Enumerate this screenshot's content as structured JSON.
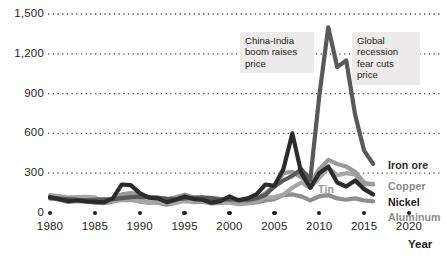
{
  "chart_data": {
    "type": "line",
    "title": "",
    "subtitle": "",
    "xlabel": "Year",
    "ylabel": "",
    "xlim": [
      1979,
      2022
    ],
    "ylim": [
      0,
      1500
    ],
    "grid": true,
    "legend_position": "right-inline",
    "y_ticks": [
      "0",
      "300",
      "600",
      "900",
      "1,200",
      "1,500"
    ],
    "y_tick_values": [
      0,
      300,
      600,
      900,
      1200,
      1500
    ],
    "x_ticks": [
      "1980",
      "1985",
      "1990",
      "1995",
      "2000",
      "2005",
      "2010",
      "2015",
      "2020"
    ],
    "x_tick_values": [
      1980,
      1985,
      1990,
      1995,
      2000,
      2005,
      2010,
      2015,
      2020
    ],
    "series": [
      {
        "name": "Iron ore",
        "color": "#595959",
        "width": 4.2,
        "label_color": "#2b2b2b",
        "label_bold": true,
        "label_x": 388,
        "label_y": 159,
        "x": [
          1980,
          1981,
          1982,
          1983,
          1984,
          1985,
          1986,
          1987,
          1988,
          1989,
          1990,
          1991,
          1992,
          1993,
          1994,
          1995,
          1996,
          1997,
          1998,
          1999,
          2000,
          2001,
          2002,
          2003,
          2004,
          2005,
          2006,
          2007,
          2008,
          2009,
          2010,
          2011,
          2012,
          2013,
          2014,
          2015,
          2016
        ],
        "y": [
          110,
          108,
          104,
          100,
          98,
          100,
          102,
          104,
          112,
          120,
          124,
          120,
          114,
          108,
          104,
          110,
          114,
          118,
          112,
          104,
          102,
          100,
          100,
          110,
          135,
          200,
          245,
          280,
          330,
          250,
          880,
          1400,
          1100,
          1150,
          740,
          470,
          370
        ]
      },
      {
        "name": "Copper",
        "color": "#9a9a9a",
        "width": 4.2,
        "label_color": "#8c8c8c",
        "label_bold": true,
        "label_x": 388,
        "label_y": 180,
        "x": [
          1980,
          1981,
          1982,
          1983,
          1984,
          1985,
          1986,
          1987,
          1988,
          1989,
          1990,
          1991,
          1992,
          1993,
          1994,
          1995,
          1996,
          1997,
          1998,
          1999,
          2000,
          2001,
          2002,
          2003,
          2004,
          2005,
          2006,
          2007,
          2008,
          2009,
          2010,
          2011,
          2012,
          2013,
          2014,
          2015,
          2016
        ],
        "y": [
          120,
          112,
          100,
          104,
          96,
          92,
          90,
          110,
          140,
          150,
          140,
          120,
          118,
          100,
          118,
          138,
          118,
          116,
          92,
          88,
          100,
          90,
          88,
          104,
          150,
          200,
          300,
          310,
          270,
          220,
          330,
          400,
          370,
          350,
          310,
          230,
          215
        ]
      },
      {
        "name": "Nickel",
        "color": "#2b2b2b",
        "width": 4.2,
        "label_color": "#1a1a1a",
        "label_bold": true,
        "label_x": 388,
        "label_y": 196,
        "x": [
          1980,
          1981,
          1982,
          1983,
          1984,
          1985,
          1986,
          1987,
          1988,
          1989,
          1990,
          1991,
          1992,
          1993,
          1994,
          1995,
          1996,
          1997,
          1998,
          1999,
          2000,
          2001,
          2002,
          2003,
          2004,
          2005,
          2006,
          2007,
          2008,
          2009,
          2010,
          2011,
          2012,
          2013,
          2014,
          2015,
          2016
        ],
        "y": [
          120,
          105,
          90,
          96,
          88,
          84,
          80,
          110,
          215,
          210,
          150,
          115,
          110,
          82,
          100,
          125,
          105,
          100,
          78,
          90,
          125,
          95,
          110,
          140,
          215,
          205,
          330,
          600,
          300,
          190,
          300,
          350,
          230,
          200,
          245,
          180,
          140
        ]
      },
      {
        "name": "Aluminum",
        "color": "#8e8e8e",
        "width": 4.2,
        "label_color": "#8c8c8c",
        "label_bold": true,
        "label_x": 388,
        "label_y": 211,
        "x": [
          1980,
          1981,
          1982,
          1983,
          1984,
          1985,
          1986,
          1987,
          1988,
          1989,
          1990,
          1991,
          1992,
          1993,
          1994,
          1995,
          1996,
          1997,
          1998,
          1999,
          2000,
          2001,
          2002,
          2003,
          2004,
          2005,
          2006,
          2007,
          2008,
          2009,
          2010,
          2011,
          2012,
          2013,
          2014,
          2015,
          2016
        ],
        "y": [
          118,
          100,
          84,
          90,
          86,
          78,
          74,
          86,
          120,
          115,
          100,
          80,
          78,
          62,
          76,
          100,
          82,
          86,
          72,
          76,
          86,
          76,
          74,
          80,
          95,
          105,
          135,
          140,
          125,
          95,
          125,
          135,
          110,
          100,
          110,
          95,
          88
        ]
      },
      {
        "name": "Tin",
        "color": "#a6a6a6",
        "width": 4.2,
        "label_color": "#9a9a9a",
        "label_bold": true,
        "label_x": 318,
        "label_y": 183,
        "x": [
          1980,
          1981,
          1982,
          1983,
          1984,
          1985,
          1986,
          1987,
          1988,
          1989,
          1990,
          1991,
          1992,
          1993,
          1994,
          1995,
          1996,
          1997,
          1998,
          1999,
          2000,
          2001,
          2002,
          2003,
          2004,
          2005,
          2006,
          2007,
          2008,
          2009,
          2010,
          2011,
          2012,
          2013,
          2014,
          2015,
          2016
        ],
        "y": [
          135,
          128,
          118,
          120,
          122,
          118,
          86,
          90,
          96,
          98,
          86,
          76,
          82,
          72,
          78,
          90,
          88,
          88,
          82,
          78,
          78,
          66,
          72,
          88,
          120,
          118,
          140,
          190,
          230,
          190,
          265,
          340,
          285,
          300,
          290,
          215,
          220
        ]
      }
    ],
    "annotations": [
      {
        "id": "china-india-boom",
        "text": "China-India\nboom raises\nprice",
        "x": 240,
        "y": 32,
        "width": 64
      },
      {
        "id": "global-recession",
        "text": "Global\nrecession\nfear cuts\nprice",
        "x": 352,
        "y": 32,
        "width": 58
      }
    ]
  },
  "axis": {
    "x_title": "Year"
  }
}
